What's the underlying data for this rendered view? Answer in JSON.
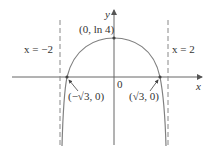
{
  "figure": {
    "function": "y = ln(4 - x^2)",
    "labels": {
      "y_axis": "y",
      "x_axis": "x",
      "origin": "0",
      "left_asymptote": "x = −2",
      "right_asymptote": "x = 2",
      "max_point": "(0, ln 4)",
      "left_intercept": "(−√3, 0)",
      "right_intercept": "(√3, 0)"
    },
    "colors": {
      "curve": "#808080",
      "axes": "#555555",
      "asymptote": "#888888",
      "text": "#333333"
    }
  }
}
